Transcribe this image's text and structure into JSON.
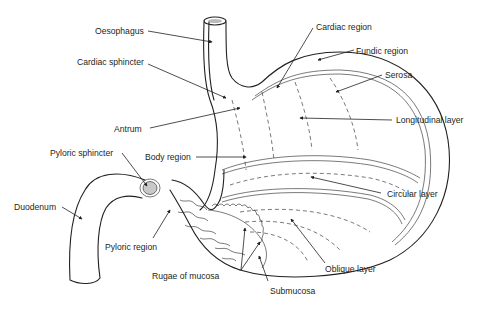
{
  "diagram": {
    "labels": {
      "oesophagus": "Oesophagus",
      "cardiac_sphincter": "Cardiac sphincter",
      "antrum": "Antrum",
      "pyloric_sphincter": "Pyloric sphincter",
      "body_region": "Body region",
      "duodenum": "Duodenum",
      "pyloric_region": "Pyloric region",
      "rugae_of_mucosa": "Rugae of mucosa",
      "submucosa": "Submucosa",
      "cardiac_region": "Cardiac region",
      "fundic_region": "Fundic region",
      "serosa": "Serosa",
      "longitudinal_layer": "Longitudinal layer",
      "circular_layer": "Circular layer",
      "oblique_layer": "Oblique layer"
    },
    "colors": {
      "line": "#231f20",
      "sphincter_fill": "#c8c8c8",
      "background": "#ffffff"
    }
  }
}
